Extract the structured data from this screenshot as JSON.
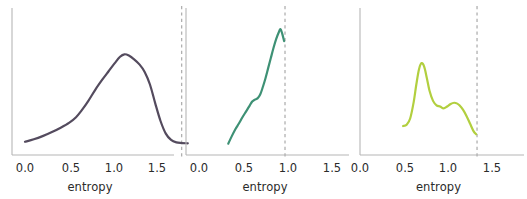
{
  "figure": {
    "type": "multi-panel-density-plot",
    "width": 527,
    "height": 199,
    "background": "#ffffff",
    "panel_count": 3,
    "shared_xlabel": "entropy",
    "shared_xticks": [
      "0.0",
      "0.5",
      "1.0",
      "1.5"
    ],
    "spine_color": "#b6b6b6",
    "tick_text_color": "#2b2b2b",
    "reference_line_color": "#b0b0b0",
    "reference_line_style": "dashed"
  },
  "chart_data": [
    {
      "type": "line",
      "id": "panel-1",
      "title": "",
      "xlabel": "entropy",
      "ylabel": "",
      "xlim": [
        -0.12,
        1.92
      ],
      "ylim": [
        0,
        1.12
      ],
      "grid": false,
      "legend": "none",
      "line_color": "#544b5e",
      "line_width": 2.2,
      "xticks": [
        0.0,
        0.5,
        1.0,
        1.5
      ],
      "xticklabels": [
        "0.0",
        "0.5",
        "1.0",
        "1.5"
      ],
      "yticks": [],
      "yticklabels": [],
      "annotations": [
        {
          "kind": "vline",
          "x": 1.78,
          "style": "dashed",
          "color": "#b0b0b0"
        }
      ],
      "x": [
        0.0,
        0.1,
        0.2,
        0.3,
        0.4,
        0.5,
        0.58,
        0.65,
        0.72,
        0.8,
        0.88,
        0.95,
        1.02,
        1.08,
        1.13,
        1.18,
        1.24,
        1.3,
        1.36,
        1.42,
        1.48,
        1.54,
        1.6,
        1.66,
        1.72,
        1.78,
        1.85
      ],
      "y": [
        0.105,
        0.125,
        0.15,
        0.18,
        0.215,
        0.255,
        0.3,
        0.36,
        0.43,
        0.52,
        0.6,
        0.665,
        0.73,
        0.78,
        0.8,
        0.79,
        0.76,
        0.72,
        0.66,
        0.56,
        0.41,
        0.27,
        0.17,
        0.12,
        0.1,
        0.095,
        0.093
      ]
    },
    {
      "type": "line",
      "id": "panel-2",
      "title": "",
      "xlabel": "entropy",
      "ylabel": "",
      "xlim": [
        -0.12,
        1.92
      ],
      "ylim": [
        0,
        1.12
      ],
      "grid": false,
      "legend": "none",
      "line_color": "#3e9175",
      "line_width": 2.2,
      "xticks": [
        0.0,
        0.5,
        1.0,
        1.5
      ],
      "xticklabels": [
        "0.0",
        "0.5",
        "1.0",
        "1.5"
      ],
      "yticks": [],
      "yticklabels": [],
      "annotations": [
        {
          "kind": "vline",
          "x": 0.97,
          "style": "dashed",
          "color": "#b0b0b0"
        }
      ],
      "x": [
        0.33,
        0.37,
        0.41,
        0.45,
        0.49,
        0.53,
        0.57,
        0.6,
        0.63,
        0.66,
        0.69,
        0.72,
        0.75,
        0.78,
        0.81,
        0.84,
        0.87,
        0.9,
        0.92,
        0.94,
        0.96
      ],
      "y": [
        0.09,
        0.15,
        0.205,
        0.25,
        0.3,
        0.345,
        0.39,
        0.425,
        0.44,
        0.45,
        0.48,
        0.54,
        0.61,
        0.69,
        0.77,
        0.85,
        0.92,
        0.975,
        1.0,
        0.96,
        0.905
      ]
    },
    {
      "type": "line",
      "id": "panel-3",
      "title": "",
      "xlabel": "entropy",
      "ylabel": "",
      "xlim": [
        -0.12,
        1.92
      ],
      "ylim": [
        0,
        1.12
      ],
      "grid": false,
      "legend": "none",
      "line_color": "#b2cf3f",
      "line_width": 2.2,
      "xticks": [
        0.0,
        0.5,
        1.0,
        1.5
      ],
      "xticklabels": [
        "0.0",
        "0.5",
        "1.0",
        "1.5"
      ],
      "yticks": [],
      "yticklabels": [],
      "annotations": [
        {
          "kind": "vline",
          "x": 1.33,
          "style": "dashed",
          "color": "#b0b0b0"
        }
      ],
      "x": [
        0.49,
        0.53,
        0.57,
        0.61,
        0.64,
        0.67,
        0.7,
        0.73,
        0.76,
        0.79,
        0.83,
        0.87,
        0.91,
        0.95,
        0.99,
        1.03,
        1.07,
        1.1,
        1.13,
        1.17,
        1.21,
        1.25,
        1.29,
        1.32
      ],
      "y": [
        0.23,
        0.24,
        0.29,
        0.42,
        0.56,
        0.68,
        0.73,
        0.7,
        0.61,
        0.51,
        0.43,
        0.395,
        0.385,
        0.37,
        0.385,
        0.405,
        0.415,
        0.41,
        0.395,
        0.36,
        0.31,
        0.25,
        0.19,
        0.165
      ]
    }
  ],
  "panels": [
    {
      "name": "panel-1",
      "left": 0,
      "width": 180,
      "plot": {
        "x0": 12,
        "x1": 174,
        "y_top": 14,
        "y_base": 155
      },
      "xlabel": "entropy",
      "ticks": [
        {
          "label": "0.0",
          "px": 25
        },
        {
          "label": "0.5",
          "px": 71
        },
        {
          "label": "1.0",
          "px": 114
        },
        {
          "label": "1.5",
          "px": 157
        }
      ]
    },
    {
      "name": "panel-2",
      "left": 175,
      "width": 180,
      "plot": {
        "x0": 186,
        "x1": 349,
        "y_top": 14,
        "y_base": 155
      },
      "xlabel": "entropy",
      "ticks": [
        {
          "label": "0.0",
          "px": 199
        },
        {
          "label": "0.5",
          "px": 244
        },
        {
          "label": "1.0",
          "px": 288
        },
        {
          "label": "1.5",
          "px": 332
        }
      ]
    },
    {
      "name": "panel-3",
      "left": 350,
      "width": 177,
      "plot": {
        "x0": 360,
        "x1": 524,
        "y_top": 14,
        "y_base": 155
      },
      "xlabel": "entropy",
      "ticks": [
        {
          "label": "0.0",
          "px": 360
        },
        {
          "label": "0.5",
          "px": 405
        },
        {
          "label": "1.0",
          "px": 448
        },
        {
          "label": "1.5",
          "px": 492
        }
      ]
    }
  ]
}
